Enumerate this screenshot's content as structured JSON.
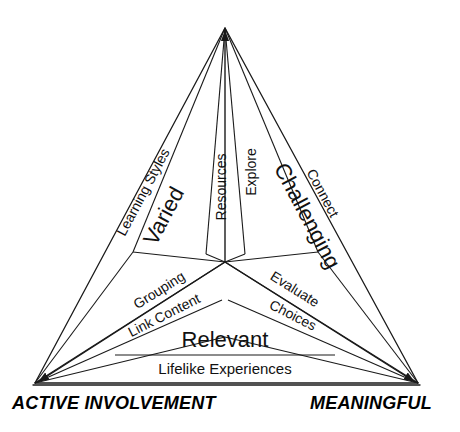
{
  "diagram": {
    "type": "triangle-framework",
    "vertices": [
      {
        "name": "apex",
        "label": "",
        "x": 225,
        "y": 28
      },
      {
        "name": "bottom-left",
        "label": "ACTIVE INVOLVEMENT",
        "x": 35,
        "y": 383
      },
      {
        "name": "bottom-right",
        "label": "MEANINGFUL",
        "x": 418,
        "y": 383
      }
    ],
    "center": {
      "x": 225,
      "y": 262
    },
    "sectors": [
      {
        "name": "varied",
        "major_label": "Varied",
        "sub_labels": [
          "Learning Styles",
          "Resources"
        ]
      },
      {
        "name": "challenging",
        "major_label": "Challenging",
        "sub_labels": [
          "Explore",
          "Connect"
        ]
      },
      {
        "name": "relevant",
        "major_label": "Relevant",
        "sub_labels": [
          "Grouping",
          "Link Content",
          "Evaluate",
          "Choices",
          "Lifelike Experiences"
        ]
      }
    ],
    "labels": {
      "learning_styles": "Learning Styles",
      "varied": "Varied",
      "resources": "Resources",
      "explore": "Explore",
      "challenging": "Challenging",
      "connect": "Connect",
      "grouping": "Grouping",
      "link_content": "Link Content",
      "evaluate": "Evaluate",
      "choices": "Choices",
      "relevant": "Relevant",
      "lifelike_experiences": "Lifelike Experiences",
      "active_involvement": "ACTIVE INVOLVEMENT",
      "meaningful": "MEANINGFUL"
    },
    "colors": {
      "stroke": "#1a1a1a",
      "background": "#ffffff",
      "text": "#111111"
    }
  }
}
